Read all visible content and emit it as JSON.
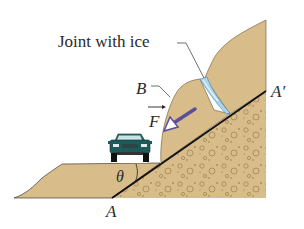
{
  "figure": {
    "labels": {
      "joint": "Joint with ice",
      "block": "B",
      "force": "F",
      "angle": "θ",
      "point_a": "A",
      "point_a_prime": "A′"
    },
    "colors": {
      "rock": "#d8bd8a",
      "rock_dark": "#b89a68",
      "ice": "#a9d6ee",
      "ice_highlight": "#e8f6fc",
      "force_arrow": "#5a4f9c",
      "car_body": "#1f5a5a",
      "line": "#111111",
      "text": "#2a2a2a"
    },
    "elements": {
      "car": "car-icon",
      "force_vector": "arrow-down-left-icon",
      "slip_plane": "line A–A′"
    }
  }
}
